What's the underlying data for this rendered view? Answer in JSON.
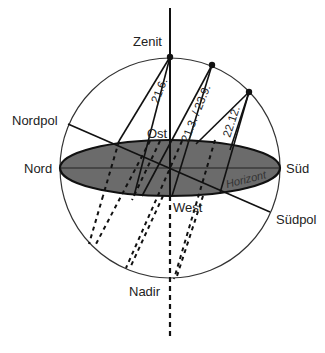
{
  "diagram": {
    "labels": {
      "zenit": "Zenit",
      "nadir": "Nadir",
      "nord": "Nord",
      "sued": "Süd",
      "ost": "Ost",
      "west": "West",
      "nordpol": "Nordpol",
      "suedpol": "Südpol",
      "horizont": "Horizont"
    },
    "sun_paths": [
      {
        "date": "21.6."
      },
      {
        "date": "21.3. / 23.9."
      },
      {
        "date": "22.12."
      }
    ],
    "colors": {
      "horizon_fill": "#6b6b6b",
      "lines": "#1a1a1a",
      "background": "#ffffff"
    }
  }
}
